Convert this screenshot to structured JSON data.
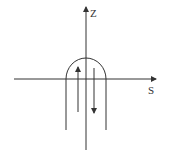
{
  "diagram": {
    "axes": {
      "vertical": {
        "label": "Z"
      },
      "horizontal": {
        "label": "S"
      }
    },
    "elements": [
      {
        "name": "u-shaped-loop",
        "description": "inverted U arch centered on Z axis, legs extending below S axis"
      },
      {
        "name": "upward-arrow",
        "direction": "up"
      },
      {
        "name": "downward-arrow",
        "direction": "down"
      }
    ],
    "colors": {
      "stroke": "#333333",
      "background": "#ffffff"
    }
  }
}
